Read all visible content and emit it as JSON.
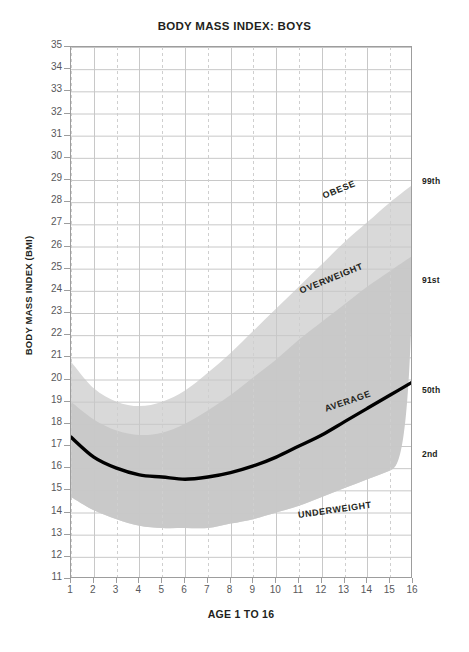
{
  "chart_data": {
    "type": "area",
    "title": "BODY MASS INDEX: BOYS",
    "xlabel": "AGE 1 TO 16",
    "ylabel": "BODY MASS INDEX (BMI)",
    "xlim": [
      1,
      16
    ],
    "ylim": [
      11,
      35
    ],
    "grid": true,
    "legend_position": "right-axis-annotations",
    "x": [
      1,
      2,
      3,
      4,
      5,
      6,
      7,
      8,
      9,
      10,
      11,
      12,
      13,
      14,
      15,
      16
    ],
    "xticklabels": [
      "1",
      "2",
      "3",
      "4",
      "5",
      "6",
      "7",
      "8",
      "9",
      "10",
      "11",
      "12",
      "13",
      "14",
      "15",
      "16"
    ],
    "yticklabels": [
      "35",
      "34",
      "33",
      "32",
      "31",
      "30",
      "29",
      "28",
      "27",
      "26",
      "25",
      "24",
      "23",
      "22",
      "21",
      "20",
      "19",
      "18",
      "17",
      "16",
      "15",
      "14",
      "13",
      "12",
      "11"
    ],
    "series": [
      {
        "name": "99th",
        "label": "99th",
        "values": [
          20.8,
          19.6,
          19.0,
          18.8,
          19.0,
          19.5,
          20.3,
          21.2,
          22.2,
          23.2,
          24.2,
          25.2,
          26.2,
          27.1,
          28.0,
          28.8
        ]
      },
      {
        "name": "91st",
        "label": "91st",
        "values": [
          19.0,
          18.2,
          17.7,
          17.5,
          17.6,
          18.0,
          18.6,
          19.3,
          20.1,
          20.9,
          21.8,
          22.6,
          23.4,
          24.2,
          24.9,
          25.6
        ]
      },
      {
        "name": "50th",
        "label": "50th",
        "values": [
          17.4,
          16.5,
          16.0,
          15.7,
          15.6,
          15.5,
          15.6,
          15.8,
          16.1,
          16.5,
          17.0,
          17.5,
          18.1,
          18.7,
          19.3,
          19.9
        ]
      },
      {
        "name": "2nd",
        "label": "2nd",
        "values": [
          14.7,
          14.1,
          13.7,
          13.4,
          13.3,
          13.3,
          13.3,
          13.5,
          13.7,
          14.0,
          14.3,
          14.7,
          15.1,
          15.5,
          15.9,
          16.3
        ]
      }
    ],
    "bands": [
      {
        "name": "obese",
        "label": "OBESE",
        "above": "99th"
      },
      {
        "name": "overweight",
        "label": "OVERWEIGHT",
        "between": [
          "91st",
          "99th"
        ]
      },
      {
        "name": "healthy",
        "label": "",
        "between": [
          "2nd",
          "91st"
        ]
      },
      {
        "name": "underweight",
        "label": "UNDERWEIGHT",
        "below": "2nd"
      }
    ],
    "annotations": [
      {
        "text": "OBESE",
        "x": 12.1,
        "y": 28.2,
        "rotation": -22
      },
      {
        "text": "OVERWEIGHT",
        "x": 11.1,
        "y": 23.9,
        "rotation": -22
      },
      {
        "text": "AVERAGE",
        "x": 12.2,
        "y": 18.6,
        "rotation": -19
      },
      {
        "text": "UNDERWEIGHT",
        "x": 11.0,
        "y": 13.8,
        "rotation": -8
      }
    ],
    "percentile_labels": [
      {
        "text": "99th",
        "y": 28.85
      },
      {
        "text": "91st",
        "y": 24.4
      },
      {
        "text": "50th",
        "y": 19.45
      },
      {
        "text": "2nd",
        "y": 16.55
      }
    ],
    "colors": {
      "average_line": "#000000",
      "band_outer": "#d9d9d9",
      "band_inner": "#c9c9c9",
      "band_white": "#ffffff",
      "grid_major": "#c8c8c8",
      "grid_minor": "#cfcfcf",
      "axis": "#9d9d9d",
      "text": "#231f20",
      "tick_text": "#58585b"
    }
  }
}
